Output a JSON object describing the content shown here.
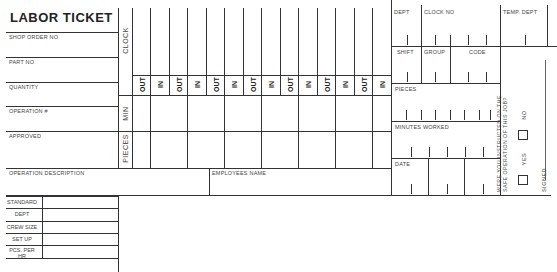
{
  "form": {
    "title": "LABOR TICKET",
    "left_fields": [
      {
        "label": "SHOP ORDER NO"
      },
      {
        "label": "PART NO"
      },
      {
        "label": "QUANTITY"
      },
      {
        "label": "OPERATION #"
      },
      {
        "label": "APPROVED"
      }
    ],
    "operation_description": {
      "label": "OPERATION DESCRIPTION"
    },
    "employees_name": {
      "label": "EMPLOYEES NAME"
    },
    "row_labels": {
      "clock": "CLOCK",
      "min": "MIN",
      "pieces": "PIECES"
    },
    "time_columns": [
      "OUT",
      "IN",
      "OUT",
      "IN",
      "OUT",
      "IN",
      "OUT",
      "IN",
      "OUT",
      "IN",
      "OUT",
      "IN",
      "OUT",
      "IN"
    ],
    "standards": [
      {
        "label": "STANDARD"
      },
      {
        "label": "DEPT"
      },
      {
        "label": "CREW SIZE"
      },
      {
        "label": "SET UP"
      },
      {
        "label": "PCS. PER HR"
      }
    ],
    "right_panel": {
      "dept": "DEPT",
      "clock_no": "CLOCK NO",
      "temp_dept": "TEMP. DEPT",
      "shift": "SHIFT",
      "group": "GROUP",
      "code": "CODE",
      "pieces": "PIECES",
      "minutes_worked": "MINUTES WORKED",
      "date": "DATE"
    },
    "safety": {
      "question_line1": "WERE YOU INSTRUCTED ON THE",
      "question_line2": "SAFE OPERATION OF THIS JOB?",
      "no_label": "NO",
      "yes_label": "YES",
      "signed_label": "SIGNED"
    }
  }
}
